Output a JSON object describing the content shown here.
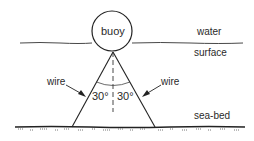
{
  "diagram": {
    "labels": {
      "buoy": "buoy",
      "water": "water",
      "surface": "surface",
      "sea_bed": "sea-bed",
      "wire_left": "wire",
      "wire_right": "wire",
      "angle_left": "30°",
      "angle_right": "30°"
    },
    "colors": {
      "line": "#222222",
      "text": "#2a2a2a",
      "background": "#ffffff"
    }
  }
}
